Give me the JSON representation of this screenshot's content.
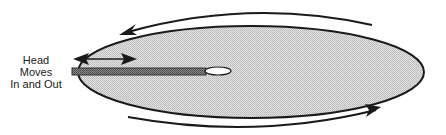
{
  "diagram": {
    "label": {
      "lines": [
        "Head",
        "Moves",
        "In and Out"
      ]
    },
    "colors": {
      "disk_fill": "#d4d4d4",
      "outline": "#1a1a1a",
      "arm_fill": "#6e6e6e",
      "hole_fill": "#ffffff",
      "background": "#ffffff"
    },
    "elements": {
      "disk": {
        "cx": 251,
        "cy": 72,
        "rx": 173,
        "ry": 46
      },
      "spindle_hole": {
        "cx": 218,
        "cy": 71,
        "rx": 13,
        "ry": 4
      },
      "head_arm": {
        "x": 72,
        "y": 68,
        "width": 134,
        "height": 7
      },
      "head_motion_arrow": {
        "x1": 74,
        "x2": 136,
        "y": 59,
        "direction": "bidirectional"
      },
      "rotation_arrow_top": {
        "direction": "counterclockwise-left"
      },
      "rotation_arrow_bottom": {
        "direction": "right"
      }
    }
  }
}
